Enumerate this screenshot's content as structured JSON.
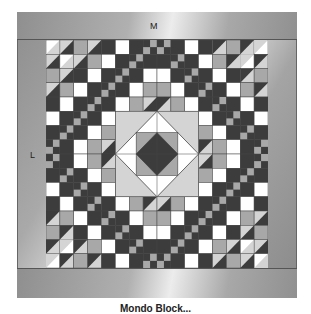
{
  "labels": {
    "top_border": "M",
    "side_border": "L"
  },
  "caption": "Mondo Block...",
  "colors": {
    "dark": "#3c3c3c",
    "medium": "#a8a8a8",
    "light": "#d4d4d4",
    "white": "#ffffff",
    "line": "#444444"
  }
}
